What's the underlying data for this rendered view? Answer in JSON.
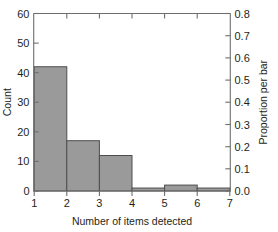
{
  "chart_data": {
    "type": "bar",
    "title": "",
    "subtitle": "",
    "xlabel": "Number of items detected",
    "ylabel": "Count",
    "y2label": "Proportion per bar",
    "grid": false,
    "legend": null,
    "legend_position": "none",
    "bin_edges": [
      1,
      2,
      3,
      4,
      5,
      6,
      7
    ],
    "categories": [
      "1-2",
      "2-3",
      "3-4",
      "4-5",
      "5-6",
      "6-7"
    ],
    "values": [
      42,
      17,
      12,
      1,
      2,
      1
    ],
    "proportions": [
      0.56,
      0.2267,
      0.16,
      0.0133,
      0.0267,
      0.0133
    ],
    "xlim": [
      1,
      7
    ],
    "ylim": [
      0,
      60
    ],
    "y2lim": [
      0.0,
      0.8
    ],
    "xticks": [
      "1",
      "2",
      "3",
      "4",
      "5",
      "6",
      "7"
    ],
    "xtick_values": [
      1,
      2,
      3,
      4,
      5,
      6,
      7
    ],
    "yticks": [
      "0",
      "10",
      "20",
      "30",
      "40",
      "50",
      "60"
    ],
    "ytick_values": [
      0,
      10,
      20,
      30,
      40,
      50,
      60
    ],
    "y2ticks": [
      "0.0",
      "0.1",
      "0.2",
      "0.3",
      "0.4",
      "0.5",
      "0.6",
      "0.7",
      "0.8"
    ],
    "y2tick_values": [
      0.0,
      0.1,
      0.2,
      0.3,
      0.4,
      0.5,
      0.6,
      0.7,
      0.8
    ],
    "total_count": 75,
    "colors": {
      "bar_fill": "#9a9a9a",
      "bar_edge": "#4d4d4d",
      "axis": "#6e6e6e",
      "text": "#231f20",
      "background": "#ffffff"
    }
  }
}
